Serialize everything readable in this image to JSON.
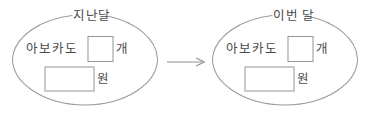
{
  "canvas": {
    "width": 365,
    "height": 119,
    "background": "#ffffff",
    "stroke_color": "#9a9a9a",
    "text_color": "#4a4a4a"
  },
  "diagram": {
    "type": "worksheet-fill-in-the-blank",
    "connector": {
      "name": "arrow",
      "glyph": "→",
      "direction": "right"
    },
    "groups": [
      {
        "id": "last-month",
        "title": "지난달",
        "item_label": "아보카도",
        "count_box": {
          "value": "",
          "unit": "개"
        },
        "price_box": {
          "value": "",
          "unit": "원"
        }
      },
      {
        "id": "this-month",
        "title": "이번 달",
        "item_label": "아보카도",
        "count_box": {
          "value": "",
          "unit": "개"
        },
        "price_box": {
          "value": "",
          "unit": "원"
        }
      }
    ]
  }
}
